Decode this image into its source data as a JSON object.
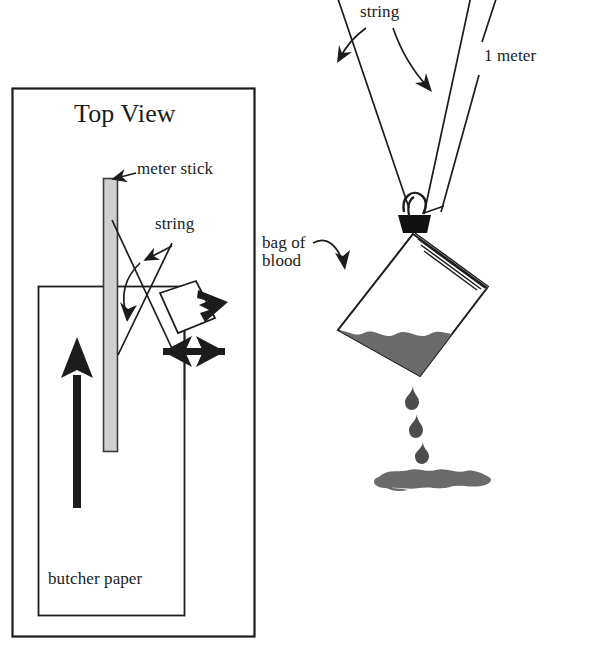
{
  "figure": {
    "title_caption": "Top View",
    "background_color": "#ffffff",
    "ink_color": "#1c1c1c",
    "blood_gray": "#6a6a6a",
    "stick_gray": "#cfcfcf",
    "clip_black": "#111111"
  },
  "top_view_panel": {
    "caption": "Top View",
    "labels": {
      "meter_stick": "meter stick",
      "string": "string",
      "butcher_paper": "butcher paper"
    },
    "elements": {
      "outer_frame": "outer-frame-rectangle",
      "paper_rectangle": "butcher-paper-rectangle",
      "meter_stick_bar": "meter-stick-bar",
      "bag_outline": "bag-top-view-outline",
      "swing_arrow": "horizontal-double-arrow",
      "direction_arrow": "upward-arrow"
    }
  },
  "side_view_panel": {
    "labels": {
      "string": "string",
      "one_meter": "1 meter",
      "bag_of_blood": "bag of\nblood"
    },
    "elements": {
      "string_left": "string-line-left",
      "meter_stick_rod": "meter-stick-rod",
      "binder_clip": "binder-clip",
      "bag": "blood-bag",
      "blood_fill": "blood-fill",
      "drips": [
        "drip-1",
        "drip-2",
        "drip-3"
      ],
      "splatter": "blood-splatter-pool"
    },
    "drip_count": 3
  }
}
